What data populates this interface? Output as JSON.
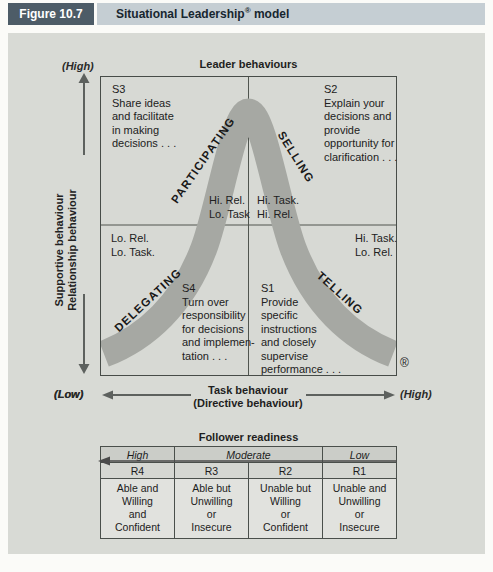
{
  "header": {
    "figure_label": "Figure 10.7",
    "title_pre": "Situational Leadership",
    "title_reg": "®",
    "title_post": " model"
  },
  "diagram": {
    "top_label": "Leader behaviours",
    "registered_mark": "®",
    "y_axis": {
      "high": "(High)",
      "low": "(Low)",
      "label": "Supportive behaviour\nRelationship behaviour"
    },
    "x_axis": {
      "low": "(Low)",
      "high": "(High)",
      "label": "Task behaviour\n(Directive behaviour)"
    },
    "styles": {
      "participating": "PARTICIPATING",
      "selling": "SELLING",
      "delegating": "DELEGATING",
      "telling": "TELLING"
    },
    "quadrants": {
      "s3": "S3\nShare ideas\nand facilitate\nin making\ndecisions . . .",
      "s2": "S2\nExplain your\ndecisions and\nprovide\nopportunity for\nclarification . . .",
      "s4": "S4\nTurn over\nresponsibility\nfor decisions\nand implemen-\ntation . . .",
      "s1": "S1\nProvide\nspecific\ninstructions\nand closely\nsupervise\nperformance . . ."
    },
    "combos": {
      "upper_left": "Hi. Rel.\nLo. Task",
      "upper_right": "Hi. Task.\nHi. Rel.",
      "lower_left": "Lo. Rel.\nLo. Task.",
      "lower_right": "Hi. Task.\nLo. Rel."
    }
  },
  "readiness": {
    "title": "Follower readiness",
    "levels": {
      "high": "High",
      "moderate": "Moderate",
      "low": "Low"
    },
    "r4": {
      "code": "R4",
      "desc": "Able and\nWilling\nand\nConfident"
    },
    "r3": {
      "code": "R3",
      "desc": "Able but\nUnwilling\nor\nInsecure"
    },
    "r2": {
      "code": "R2",
      "desc": "Unable but\nWilling\nor\nConfident"
    },
    "r1": {
      "code": "R1",
      "desc": "Unable and\nUnwilling\nor\nInsecure"
    }
  },
  "colors": {
    "header_box": "#4d5c67",
    "header_strip": "#c5ced3",
    "panel_bg": "#d8dad5",
    "chart_bg": "#d7d9d4",
    "curve_band": "#a6a8a3",
    "border": "#474c48",
    "arrow": "#5d615e"
  }
}
